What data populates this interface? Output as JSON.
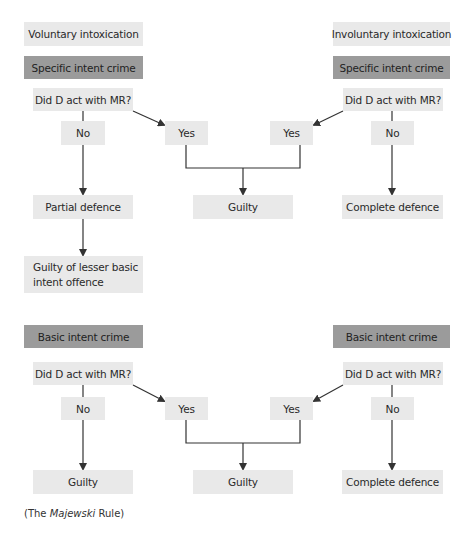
{
  "top": {
    "left": {
      "header": "Voluntary intoxication",
      "crime": "Specific intent crime",
      "question": "Did D act with MR?",
      "no": "No",
      "yes": "Yes",
      "outcome_no": "Partial defence",
      "outcome_no_2": "Guilty of lesser basic intent offence"
    },
    "right": {
      "header": "Involuntary intoxication",
      "crime": "Specific intent crime",
      "question": "Did D act with MR?",
      "no": "No",
      "yes": "Yes",
      "outcome_no": "Complete defence"
    },
    "outcome_yes": "Guilty"
  },
  "bottom": {
    "left": {
      "crime": "Basic intent crime",
      "question": "Did D act with MR?",
      "no": "No",
      "yes": "Yes",
      "outcome_no": "Guilty"
    },
    "right": {
      "crime": "Basic intent crime",
      "question": "Did D act with MR?",
      "no": "No",
      "yes": "Yes",
      "outcome_no": "Complete defence"
    },
    "outcome_yes": "Guilty"
  },
  "caption": {
    "prefix": "(The ",
    "italic": "Majewski",
    "suffix": " Rule)"
  },
  "colors": {
    "box_light": "#e9e9e9",
    "box_dark": "#9b9b9b",
    "line": "#333333"
  }
}
